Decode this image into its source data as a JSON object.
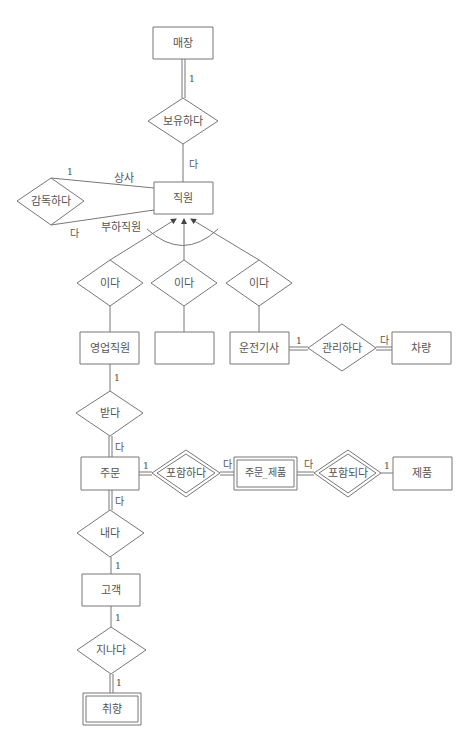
{
  "diagram": {
    "type": "ER diagram (Chen notation)",
    "entities": [
      {
        "id": "store",
        "label": "매장",
        "weak": false
      },
      {
        "id": "employee",
        "label": "직원",
        "weak": false
      },
      {
        "id": "sales_employee",
        "label": "영업직원",
        "weak": false
      },
      {
        "id": "blank_subtype",
        "label": "",
        "weak": false
      },
      {
        "id": "driver",
        "label": "운전기사",
        "weak": false
      },
      {
        "id": "vehicle",
        "label": "차량",
        "weak": false
      },
      {
        "id": "order",
        "label": "주문",
        "weak": false
      },
      {
        "id": "order_product",
        "label": "주문_제품",
        "weak": true
      },
      {
        "id": "product",
        "label": "제품",
        "weak": false
      },
      {
        "id": "customer",
        "label": "고객",
        "weak": false
      },
      {
        "id": "preference",
        "label": "취향",
        "weak": true
      }
    ],
    "relationships": [
      {
        "id": "has",
        "label": "보유하다",
        "identifying": false
      },
      {
        "id": "supervises",
        "label": "감독하다",
        "identifying": false
      },
      {
        "id": "isa_sales",
        "label": "이다",
        "identifying": false
      },
      {
        "id": "isa_blank",
        "label": "이다",
        "identifying": false
      },
      {
        "id": "isa_driver",
        "label": "이다",
        "identifying": false
      },
      {
        "id": "manages",
        "label": "관리하다",
        "identifying": false
      },
      {
        "id": "receives",
        "label": "받다",
        "identifying": false
      },
      {
        "id": "contains",
        "label": "포함하다",
        "identifying": true
      },
      {
        "id": "included",
        "label": "포함되다",
        "identifying": true
      },
      {
        "id": "places",
        "label": "내다",
        "identifying": false
      },
      {
        "id": "holds",
        "label": "지나다",
        "identifying": true
      }
    ],
    "roles": {
      "supervisor": "상사",
      "subordinate": "부하직원"
    },
    "cardinalities": {
      "store_has": "1",
      "has_employee": "다",
      "supervises_top": "1",
      "supervises_bottom": "다",
      "driver_manages": "1",
      "manages_vehicle": "다",
      "sales_receives": "1",
      "receives_order": "다",
      "order_contains": "1",
      "contains_orderproduct": "다",
      "orderproduct_included": "다",
      "included_product": "1",
      "order_places": "다",
      "places_customer": "1",
      "customer_holds": "1",
      "holds_preference": "1"
    }
  }
}
